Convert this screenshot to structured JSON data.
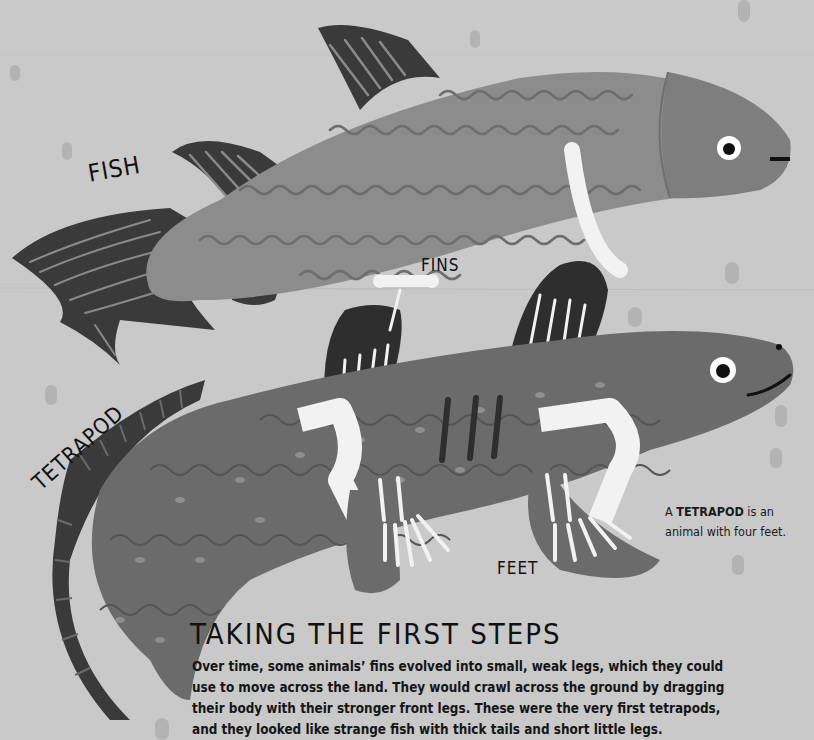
{
  "labels": {
    "fish": "FISH",
    "fins": "FINS",
    "tetrapod": "TETRAPOD",
    "feet": "FEET"
  },
  "definition": {
    "prefix": "A ",
    "term": "TETRAPOD",
    "suffix": " is an animal with four feet."
  },
  "section": {
    "heading": "TAKING THE FIRST STEPS",
    "lines": [
      "Over time, some animals’ fins evolved into small, weak legs, which they could",
      "use to move across the land. They would crawl across the ground by dragging",
      "their body with their stronger front legs. These were the very first tetrapods,",
      "and they looked like strange fish with thick tails and short little legs."
    ]
  },
  "colors": {
    "background": "#c9c9c9",
    "fish_body": "#8c8c8c",
    "fish_head": "#7e7e7e",
    "fin_dark": "#3a3a3a",
    "tetrapod_body": "#6b6b6b",
    "bone": "#f2f2f2",
    "text": "#111111"
  }
}
